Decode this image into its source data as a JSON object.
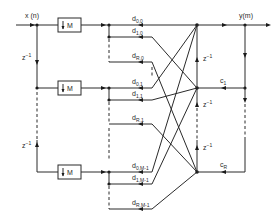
{
  "diagram": {
    "type": "polyphase filter bank / signal flow graph",
    "input_label": "x (n)",
    "output_label": "y(m)",
    "delay_label": "z",
    "delay_exp": "−1",
    "decimator_label": "M",
    "branches": [
      {
        "index": 0,
        "outputs": [
          {
            "d": "d",
            "sub": "0,0"
          },
          {
            "d": "d",
            "sub": "1,0"
          },
          {
            "d": "d",
            "sub": "R,0"
          }
        ]
      },
      {
        "index": 1,
        "outputs": [
          {
            "d": "d",
            "sub": "0,1"
          },
          {
            "d": "d",
            "sub": "1,1"
          },
          {
            "d": "d",
            "sub": "R,1"
          }
        ]
      },
      {
        "index": 2,
        "outputs": [
          {
            "d": "d",
            "sub": "0,M-1"
          },
          {
            "d": "d",
            "sub": "1,M-1"
          },
          {
            "d": "d",
            "sub": "R,M-1"
          }
        ]
      }
    ],
    "coefficients": [
      {
        "c": "c",
        "sub": "1"
      },
      {
        "c": "c",
        "sub": "R"
      }
    ],
    "colors": {
      "line": "#2a2a2a",
      "background": "#ffffff"
    }
  }
}
